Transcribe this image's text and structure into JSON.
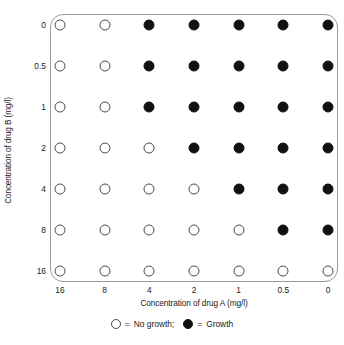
{
  "chart_data": {
    "type": "heatmap",
    "title": "",
    "xlabel": "Concentration of drug A (mg/l)",
    "ylabel": "Concentration of drug B (mg/l)",
    "x_tick_labels": [
      "16",
      "8",
      "4",
      "2",
      "1",
      "0.5",
      "0"
    ],
    "y_tick_labels": [
      "0",
      "0.5",
      "1",
      "2",
      "4",
      "8",
      "16"
    ],
    "grid": false,
    "legend_position": "bottom",
    "categories_x": [
      "16",
      "8",
      "4",
      "2",
      "1",
      "0.5",
      "0"
    ],
    "categories_y": [
      "0",
      "0.5",
      "1",
      "2",
      "4",
      "8",
      "16"
    ],
    "value_encoding": {
      "0": "no-growth",
      "1": "growth"
    },
    "rows": [
      {
        "drug_b": "0",
        "cells": [
          0,
          0,
          1,
          1,
          1,
          1,
          1
        ]
      },
      {
        "drug_b": "0.5",
        "cells": [
          0,
          0,
          1,
          1,
          1,
          1,
          1
        ]
      },
      {
        "drug_b": "1",
        "cells": [
          0,
          0,
          1,
          1,
          1,
          1,
          1
        ]
      },
      {
        "drug_b": "2",
        "cells": [
          0,
          0,
          0,
          1,
          1,
          1,
          1
        ]
      },
      {
        "drug_b": "4",
        "cells": [
          0,
          0,
          0,
          0,
          1,
          1,
          1
        ]
      },
      {
        "drug_b": "8",
        "cells": [
          0,
          0,
          0,
          0,
          0,
          1,
          1
        ]
      },
      {
        "drug_b": "16",
        "cells": [
          0,
          0,
          0,
          0,
          0,
          0,
          0
        ]
      }
    ],
    "legend": [
      {
        "marker": "open-circle",
        "separator": "=",
        "label": "No growth;"
      },
      {
        "marker": "filled-circle",
        "separator": "=",
        "label": "Growth"
      }
    ],
    "colors": {
      "growth_fill": "#111111",
      "nogrowth_fill": "#ffffff",
      "marker_stroke": "#4d4d4d",
      "frame_stroke": "#9a9a9a",
      "text": "#1a1a1a",
      "background": "#ffffff"
    }
  }
}
